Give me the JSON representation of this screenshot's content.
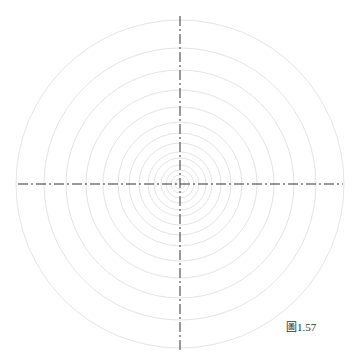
{
  "figure": {
    "caption": "圖1.57",
    "center": [
      180,
      184
    ],
    "circle_radii": [
      164,
      136,
      114,
      94,
      77,
      62,
      51,
      41,
      32,
      26,
      19,
      14,
      9,
      5
    ],
    "circle_color": "#dcdcdc",
    "axis_color": "#333333",
    "horizontal_axis": {
      "x1": 18,
      "x2": 343,
      "y": 184
    },
    "vertical_axis": {
      "x": 180,
      "y1": 16,
      "y2": 350
    }
  }
}
